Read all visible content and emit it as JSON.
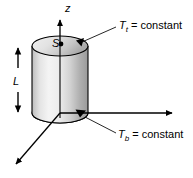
{
  "figure": {
    "title_label_z_axis": "z",
    "length_label": "L",
    "surface_label": "S",
    "top_boundary": {
      "variable": "T",
      "subscript": "t",
      "relation": " = constant",
      "full_text": "Tt = constant"
    },
    "bottom_boundary": {
      "variable": "T",
      "subscript": "b",
      "relation": " = constant",
      "full_text": "Tb = constant"
    },
    "colors": {
      "stroke": "#000000",
      "background": "#ffffff",
      "cylinder_light": "#f2f2f2",
      "cylinder_mid": "#d8d8d8",
      "cylinder_dark": "#9a9a9a",
      "top_face_light": "#e8e8e8",
      "top_face_dark": "#b4b4b4"
    },
    "geometry": {
      "cylinder_center_x": 60,
      "cylinder_radius_x": 28,
      "ellipse_radius_y": 10,
      "top_ellipse_center_y": 46,
      "bottom_ellipse_center_y": 113,
      "z_axis_top_y": 14,
      "x_axis_right_x": 178,
      "diagonal_axis_end": [
        10,
        168
      ]
    }
  }
}
